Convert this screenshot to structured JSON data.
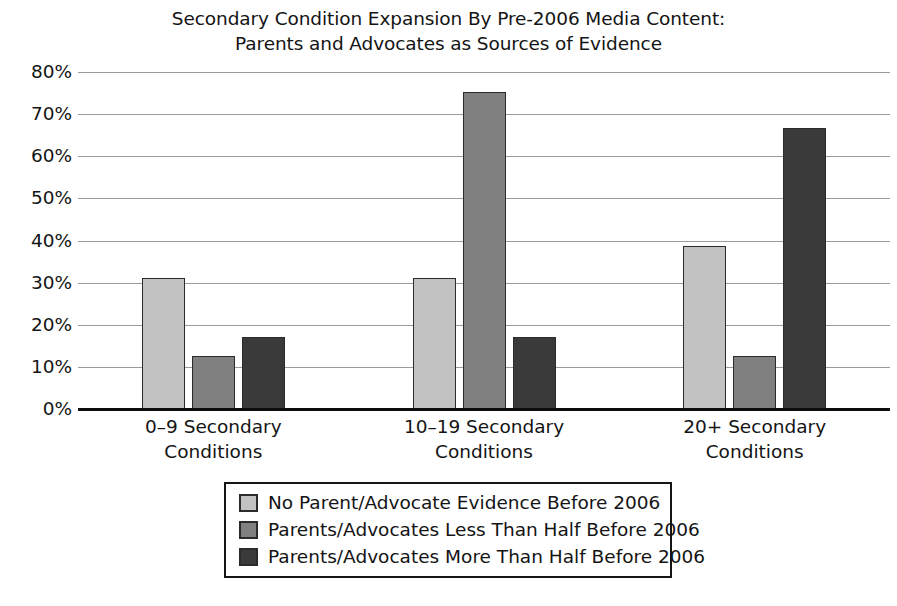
{
  "chart_data": {
    "type": "bar",
    "title": "Secondary Condition Expansion By Pre-2006 Media Content: Parents and Advocates as Sources of Evidence",
    "title_lines": [
      "Secondary Condition Expansion By Pre-2006 Media Content:",
      "Parents and Advocates as Sources of Evidence"
    ],
    "xlabel": "",
    "ylabel": "",
    "ylim": [
      0,
      80
    ],
    "ytick_values": [
      80,
      70,
      60,
      50,
      40,
      30,
      20,
      10,
      0
    ],
    "ytick_labels": [
      "80%",
      "70%",
      "60%",
      "50%",
      "40%",
      "30%",
      "20%",
      "10%",
      "0%"
    ],
    "grid": true,
    "legend_position": "bottom",
    "categories": [
      "0–9 Secondary Conditions",
      "10–19 Secondary Conditions",
      "20+ Secondary Conditions"
    ],
    "category_lines": [
      [
        "0–9 Secondary",
        "Conditions"
      ],
      [
        "10–19 Secondary",
        "Conditions"
      ],
      [
        "20+ Secondary",
        "Conditions"
      ]
    ],
    "series": [
      {
        "name": "No Parent/Advocate Evidence Before 2006",
        "color": "#c2c2c2",
        "values": [
          31.0,
          31.0,
          38.6
        ]
      },
      {
        "name": "Parents/Advocates Less Than Half Before 2006",
        "color": "#808080",
        "values": [
          12.5,
          75.3,
          12.5
        ]
      },
      {
        "name": "Parents/Advocates More Than Half Before 2006",
        "color": "#3a3a3a",
        "values": [
          17.0,
          17.0,
          66.6
        ]
      }
    ]
  },
  "style": {
    "background": "#ffffff",
    "text_color": "#141414",
    "gridline_color": "#9a9a9a",
    "axis_color": "#0d0d0d",
    "bar_border_color": "#2b2b2b",
    "legend_border_color": "#151515"
  }
}
